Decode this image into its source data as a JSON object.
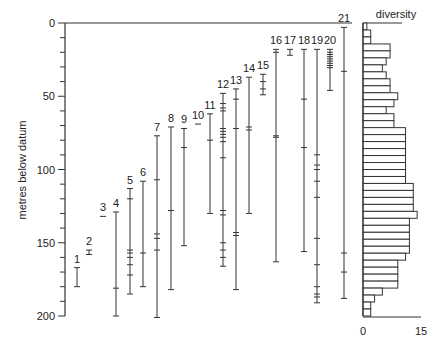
{
  "chart_data": [
    {
      "type": "range",
      "title": "",
      "ylabel": "metres below datum",
      "xlabel": "",
      "ylim": [
        0,
        200
      ],
      "y_inverted": true,
      "y_ticks": [
        0,
        50,
        100,
        150,
        200
      ],
      "y_minor_step": 10,
      "grid": false,
      "columns": [
        {
          "label": "1",
          "x": 77,
          "top": 167,
          "bottom": 180,
          "ticks": []
        },
        {
          "label": "2",
          "x": 89,
          "top": 155,
          "bottom": 158,
          "ticks": []
        },
        {
          "label": "3",
          "x": 103,
          "top": 132,
          "bottom": 132,
          "ticks": []
        },
        {
          "label": "4",
          "x": 116,
          "top": 129,
          "bottom": 200,
          "ticks": [
            181
          ]
        },
        {
          "label": "5",
          "x": 130,
          "top": 113,
          "bottom": 185,
          "ticks": [
            120,
            155,
            157,
            160,
            165,
            172
          ]
        },
        {
          "label": "6",
          "x": 143,
          "top": 108,
          "bottom": 180,
          "ticks": [
            157
          ]
        },
        {
          "label": "7",
          "x": 157,
          "top": 77,
          "bottom": 201,
          "ticks": [
            107,
            144,
            147,
            155
          ]
        },
        {
          "label": "8",
          "x": 171,
          "top": 71,
          "bottom": 182,
          "ticks": [
            128
          ]
        },
        {
          "label": "9",
          "x": 184,
          "top": 72,
          "bottom": 152,
          "ticks": [
            85
          ]
        },
        {
          "label": "10",
          "x": 198,
          "top": 69,
          "bottom": 69,
          "ticks": []
        },
        {
          "label": "11",
          "x": 210,
          "top": 62,
          "bottom": 130,
          "ticks": [
            80
          ]
        },
        {
          "label": "12",
          "x": 223,
          "top": 48,
          "bottom": 166,
          "ticks": [
            55,
            58,
            60,
            72,
            74,
            76,
            78,
            81,
            92,
            128,
            131,
            150,
            155,
            160
          ]
        },
        {
          "label": "13",
          "x": 236,
          "top": 45,
          "bottom": 182,
          "ticks": [
            52,
            72,
            143,
            145
          ]
        },
        {
          "label": "14",
          "x": 249,
          "top": 37,
          "bottom": 130,
          "ticks": [
            71,
            73
          ]
        },
        {
          "label": "15",
          "x": 263,
          "top": 35,
          "bottom": 49,
          "ticks": [
            40,
            45
          ]
        },
        {
          "label": "16",
          "x": 276,
          "top": 18,
          "bottom": 163,
          "ticks": [
            20,
            77,
            78
          ]
        },
        {
          "label": "17",
          "x": 290,
          "top": 18,
          "bottom": 22,
          "ticks": []
        },
        {
          "label": "18",
          "x": 304,
          "top": 18,
          "bottom": 156,
          "ticks": [
            52,
            85
          ]
        },
        {
          "label": "19",
          "x": 317,
          "top": 18,
          "bottom": 191,
          "ticks": [
            90,
            97,
            100,
            108,
            119,
            147,
            165,
            180,
            185,
            187
          ]
        },
        {
          "label": "20",
          "x": 330,
          "top": 18,
          "bottom": 46,
          "ticks": [
            20,
            21.5,
            23,
            24.5,
            26,
            27.5,
            29,
            30.5
          ]
        },
        {
          "label": "21",
          "x": 344,
          "top": 3,
          "bottom": 188,
          "ticks": [
            33,
            157,
            170
          ]
        }
      ]
    },
    {
      "type": "bar",
      "orientation": "horizontal",
      "title": "diversity",
      "xlabel": "",
      "xlim": [
        0,
        15
      ],
      "x_ticks": [
        0,
        15
      ],
      "bin_size_m": 5,
      "categories": [
        "0-5",
        "5-10",
        "10-15",
        "15-20",
        "20-25",
        "25-30",
        "30-35",
        "35-40",
        "40-45",
        "45-50",
        "50-55",
        "55-60",
        "60-65",
        "65-70",
        "70-75",
        "75-80",
        "80-85",
        "85-90",
        "90-95",
        "95-100",
        "100-105",
        "105-110",
        "110-115",
        "115-120",
        "120-125",
        "125-130",
        "130-135",
        "135-140",
        "140-145",
        "145-150",
        "150-155",
        "155-160",
        "160-165",
        "165-170",
        "170-175",
        "175-180",
        "180-185",
        "185-190",
        "190-195",
        "195-200"
      ],
      "values": [
        1,
        2,
        2,
        7,
        7,
        6,
        5,
        6,
        7,
        7,
        9,
        8,
        6,
        8,
        8,
        11,
        11,
        11,
        11,
        11,
        11,
        11,
        11,
        13,
        13,
        13,
        13,
        14,
        12,
        12,
        12,
        12,
        12,
        11,
        9,
        9,
        9,
        9,
        5,
        3,
        2,
        2
      ]
    }
  ]
}
